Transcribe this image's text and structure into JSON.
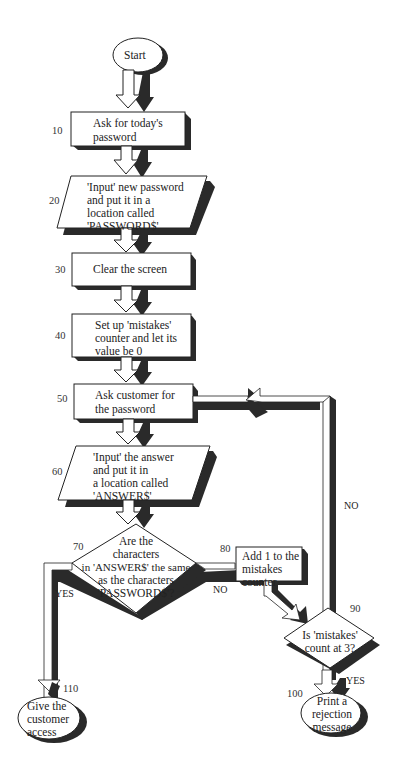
{
  "diagram": {
    "type": "flowchart",
    "colors": {
      "fill": "#ffffff",
      "stroke": "#222222",
      "shadow": "#2a2a2a"
    },
    "nodes": [
      {
        "id": "start",
        "shape": "oval",
        "text": "Start"
      },
      {
        "id": "n10",
        "number": "10",
        "shape": "process",
        "lines": [
          "Ask for today's",
          "password"
        ]
      },
      {
        "id": "n20",
        "number": "20",
        "shape": "input",
        "lines": [
          "'Input' new password",
          "and put it in a",
          "location called",
          "'PASSWORD$'"
        ]
      },
      {
        "id": "n30",
        "number": "30",
        "shape": "process",
        "lines": [
          "Clear the screen"
        ]
      },
      {
        "id": "n40",
        "number": "40",
        "shape": "process",
        "lines": [
          "Set up 'mistakes'",
          "counter and let its",
          "value be 0"
        ]
      },
      {
        "id": "n50",
        "number": "50",
        "shape": "process",
        "lines": [
          "Ask customer for",
          "the password"
        ]
      },
      {
        "id": "n60",
        "number": "60",
        "shape": "input",
        "lines": [
          "'Input' the answer",
          "and put it in",
          "a location called",
          "'ANSWER$'"
        ]
      },
      {
        "id": "n70",
        "number": "70",
        "shape": "decision",
        "lines": [
          "Are the",
          "characters",
          "in 'ANSWER$' the same",
          "as the characters",
          "'PASSWORD$'?"
        ]
      },
      {
        "id": "n80",
        "number": "80",
        "shape": "process",
        "lines": [
          "Add 1 to the",
          "mistakes",
          "counter"
        ]
      },
      {
        "id": "n90",
        "number": "90",
        "shape": "decision",
        "lines": [
          "Is 'mistakes'",
          "count at 3?"
        ]
      },
      {
        "id": "n100",
        "number": "100",
        "shape": "oval",
        "lines": [
          "Print a",
          "rejection",
          "message"
        ]
      },
      {
        "id": "n110",
        "number": "110",
        "shape": "oval",
        "lines": [
          "Give the",
          "customer",
          "access"
        ]
      }
    ],
    "edges": [
      {
        "from": "start",
        "to": "n10"
      },
      {
        "from": "n10",
        "to": "n20"
      },
      {
        "from": "n20",
        "to": "n30"
      },
      {
        "from": "n30",
        "to": "n40"
      },
      {
        "from": "n40",
        "to": "n50"
      },
      {
        "from": "n50",
        "to": "n60"
      },
      {
        "from": "n60",
        "to": "n70"
      },
      {
        "from": "n70",
        "to": "n110",
        "label": "YES"
      },
      {
        "from": "n70",
        "to": "n80",
        "label": "NO"
      },
      {
        "from": "n80",
        "to": "n90"
      },
      {
        "from": "n90",
        "to": "n100",
        "label": "YES"
      },
      {
        "from": "n90",
        "to": "n50",
        "label": "NO"
      }
    ],
    "edge_labels": {
      "yes": "YES",
      "no": "NO"
    }
  }
}
